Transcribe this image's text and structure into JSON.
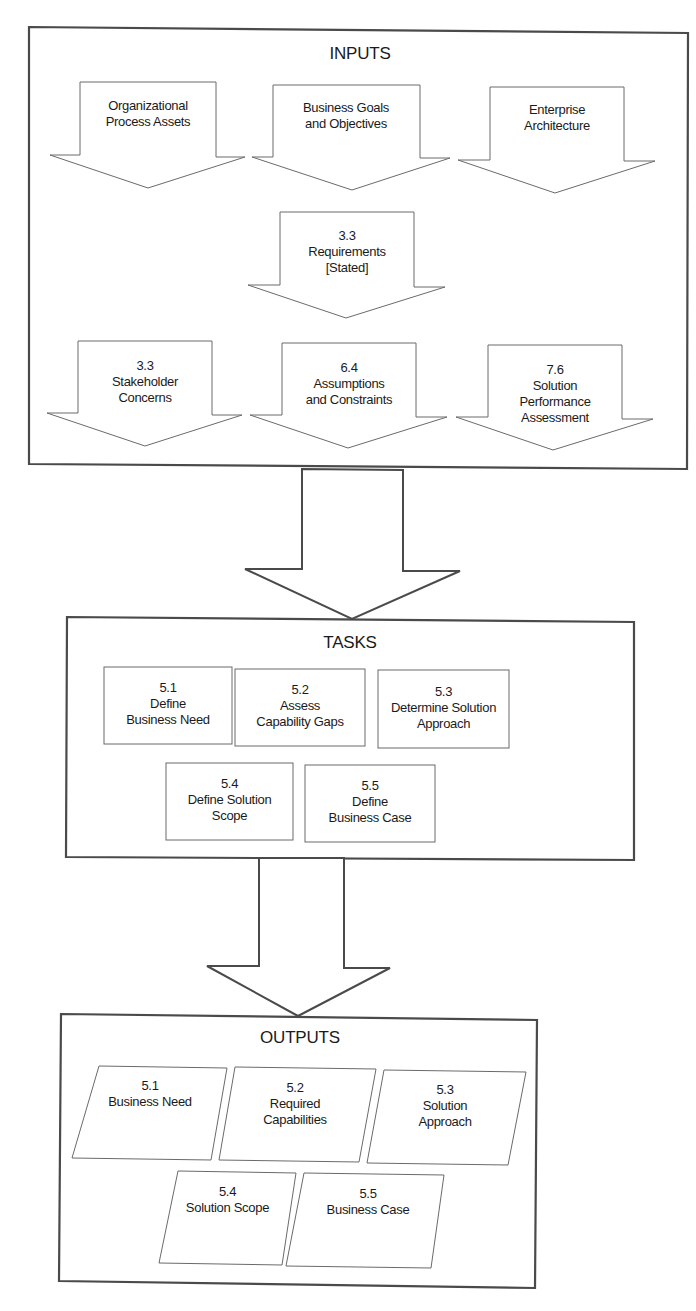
{
  "diagram": {
    "inputs": {
      "title": "INPUTS",
      "items": [
        {
          "lines": [
            "Organizational",
            "Process Assets"
          ]
        },
        {
          "lines": [
            "Business Goals",
            "and Objectives"
          ]
        },
        {
          "lines": [
            "Enterprise",
            "Architecture"
          ]
        },
        {
          "lines": [
            "3.3",
            "Requirements",
            "[Stated]"
          ]
        },
        {
          "lines": [
            "3.3",
            "Stakeholder",
            "Concerns"
          ]
        },
        {
          "lines": [
            "6.4",
            "Assumptions",
            "and Constraints"
          ]
        },
        {
          "lines": [
            "7.6",
            "Solution",
            "Performance",
            "Assessment"
          ]
        }
      ]
    },
    "tasks": {
      "title": "TASKS",
      "items": [
        {
          "lines": [
            "5.1",
            "Define",
            "Business Need"
          ]
        },
        {
          "lines": [
            "5.2",
            "Assess",
            "Capability Gaps"
          ]
        },
        {
          "lines": [
            "5.3",
            "Determine Solution",
            "Approach"
          ]
        },
        {
          "lines": [
            "5.4",
            "Define Solution",
            "Scope"
          ]
        },
        {
          "lines": [
            "5.5",
            "Define",
            "Business Case"
          ]
        }
      ]
    },
    "outputs": {
      "title": "OUTPUTS",
      "items": [
        {
          "lines": [
            "5.1",
            "Business Need"
          ]
        },
        {
          "lines": [
            "5.2",
            "Required",
            "Capabilities"
          ]
        },
        {
          "lines": [
            "5.3",
            "Solution",
            "Approach"
          ]
        },
        {
          "lines": [
            "5.4",
            "Solution Scope"
          ]
        },
        {
          "lines": [
            "5.5",
            "Business Case"
          ]
        }
      ]
    },
    "colors": {
      "frame": "#4a4a4a",
      "shape_stroke": "#6a6a6a",
      "background": "#ffffff"
    }
  }
}
